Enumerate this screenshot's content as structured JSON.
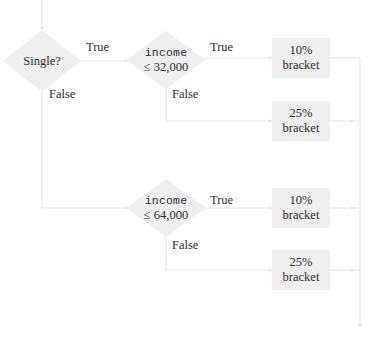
{
  "diagram": {
    "type": "flowchart",
    "colors": {
      "node_fill": "#efefef",
      "edge": "#e6e6e6",
      "text": "#2b2b2b",
      "background": "#ffffff"
    },
    "decisions": [
      {
        "id": "single",
        "label": "Single?"
      },
      {
        "id": "income32",
        "var": "income",
        "condition": "≤ 32,000"
      },
      {
        "id": "income64",
        "var": "income",
        "condition": "≤ 64,000"
      }
    ],
    "outcomes": [
      {
        "id": "b1",
        "rate": "10%",
        "label": "bracket"
      },
      {
        "id": "b2",
        "rate": "25%",
        "label": "bracket"
      },
      {
        "id": "b3",
        "rate": "10%",
        "label": "bracket"
      },
      {
        "id": "b4",
        "rate": "25%",
        "label": "bracket"
      }
    ],
    "edge_labels": {
      "single_true": "True",
      "single_false": "False",
      "income32_true": "True",
      "income32_false": "False",
      "income64_true": "True",
      "income64_false": "False"
    },
    "edges": [
      {
        "from": "start",
        "to": "single"
      },
      {
        "from": "single",
        "to": "income32",
        "label": "True"
      },
      {
        "from": "single",
        "to": "income64",
        "label": "False"
      },
      {
        "from": "income32",
        "to": "b1",
        "label": "True"
      },
      {
        "from": "income32",
        "to": "b2",
        "label": "False"
      },
      {
        "from": "income64",
        "to": "b3",
        "label": "True"
      },
      {
        "from": "income64",
        "to": "b4",
        "label": "False"
      },
      {
        "from": "b1",
        "to": "end"
      },
      {
        "from": "b2",
        "to": "end"
      },
      {
        "from": "b3",
        "to": "end"
      },
      {
        "from": "b4",
        "to": "end"
      }
    ]
  }
}
